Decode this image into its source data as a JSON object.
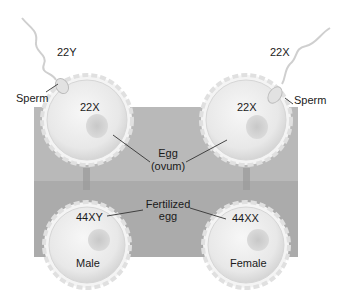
{
  "diagram": {
    "colors": {
      "background": "#ffffff",
      "band_top": "#b9b9b9",
      "band_bottom": "#ababab",
      "cell_fill": "#ececec",
      "cell_edge": "#d4d4d4",
      "nucleus": "#d2d2d2",
      "text": "#1a1a1a"
    },
    "left": {
      "sperm_chromosomes": "22Y",
      "sperm_label": "Sperm",
      "egg_chromosomes": "22X",
      "zygote_chromosomes": "44XY",
      "zygote_sex": "Male"
    },
    "right": {
      "sperm_chromosomes": "22X",
      "sperm_label": "Sperm",
      "egg_chromosomes": "22X",
      "zygote_chromosomes": "44XX",
      "zygote_sex": "Female"
    },
    "center_labels": {
      "egg_line1": "Egg",
      "egg_line2": "(ovum)",
      "fertilized_line1": "Fertilized",
      "fertilized_line2": "egg"
    }
  }
}
